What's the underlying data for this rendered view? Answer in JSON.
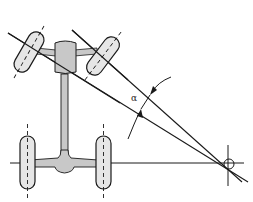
{
  "diagram": {
    "title": "",
    "angle_label": "α",
    "colors": {
      "line": "#1a1a1a",
      "wheel_fill": "#e6e6e6",
      "body_fill": "#c8c8c8",
      "background": "#ffffff"
    },
    "elements": [
      "front-left-wheel (steered)",
      "front-right-wheel (steered)",
      "rear-left-wheel",
      "rear-right-wheel",
      "vehicle-chassis",
      "rear-axle-line",
      "front-left-wheel-axis-line",
      "front-right-wheel-axis-line",
      "turning-center",
      "steering-angle-alpha"
    ]
  }
}
